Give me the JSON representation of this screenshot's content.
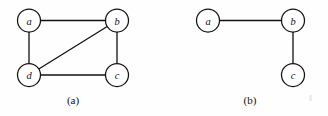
{
  "figure": {
    "background_color": "#fefefe",
    "stroke_color": "#121212",
    "node_fill": "#ffffff",
    "node_radius": 11.5,
    "panels": [
      {
        "id": "panel-a",
        "caption": "(a)",
        "caption_x": 73,
        "caption_y": 100,
        "nodes": [
          {
            "id": "a",
            "label": "a",
            "cx": 29,
            "cy": 20.5
          },
          {
            "id": "b",
            "label": "b",
            "cx": 117,
            "cy": 20.5
          },
          {
            "id": "c",
            "label": "c",
            "cx": 117,
            "cy": 75
          },
          {
            "id": "d",
            "label": "d",
            "cx": 29,
            "cy": 75
          }
        ],
        "edges": [
          {
            "id": "edge-a-b",
            "from": "a",
            "to": "b"
          },
          {
            "id": "edge-a-d",
            "from": "a",
            "to": "d"
          },
          {
            "id": "edge-b-c",
            "from": "b",
            "to": "c"
          },
          {
            "id": "edge-b-d",
            "from": "b",
            "to": "d"
          },
          {
            "id": "edge-d-c",
            "from": "d",
            "to": "c"
          }
        ]
      },
      {
        "id": "panel-b",
        "caption": "(b)",
        "caption_x": 250,
        "caption_y": 100,
        "nodes": [
          {
            "id": "a",
            "label": "a",
            "cx": 208,
            "cy": 20.5
          },
          {
            "id": "b",
            "label": "b",
            "cx": 293,
            "cy": 20.5
          },
          {
            "id": "c",
            "label": "c",
            "cx": 293,
            "cy": 75
          }
        ],
        "edges": [
          {
            "id": "edge-a-b",
            "from": "a",
            "to": "b"
          },
          {
            "id": "edge-b-c",
            "from": "b",
            "to": "c"
          }
        ]
      }
    ]
  }
}
